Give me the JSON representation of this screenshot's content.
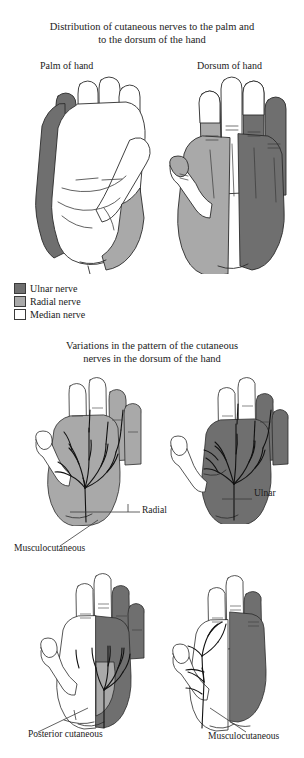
{
  "figure1": {
    "title": "Distribution of cutaneous nerves to the palm and to the dorsum of the hand",
    "title_line1": "Distribution of cutaneous nerves to the palm and",
    "title_line2": "to the dorsum of the hand",
    "panels": [
      {
        "label": "Palm of hand",
        "name": "palm-of-hand"
      },
      {
        "label": "Dorsum of hand",
        "name": "dorsum-of-hand"
      }
    ],
    "legend": [
      {
        "label": "Ulnar nerve",
        "color": "#6f6f6f"
      },
      {
        "label": "Radial nerve",
        "color": "#a9a9a9"
      },
      {
        "label": "Median nerve",
        "color": "#ffffff"
      }
    ]
  },
  "figure2": {
    "title": "Variations in the pattern of the cutaneous nerves in the dorsum of the hand",
    "title_line1": "Variations in the pattern of the cutaneous",
    "title_line2": "nerves in the dorsum of the hand",
    "callouts": [
      {
        "label": "Radial",
        "name": "callout-radial"
      },
      {
        "label": "Ulnar",
        "name": "callout-ulnar"
      },
      {
        "label": "Musculocutaneous",
        "name": "callout-musculocutaneous-upper"
      },
      {
        "label": "Posterior cutaneous",
        "name": "callout-posterior-cutaneous"
      },
      {
        "label": "Musculocutaneous",
        "name": "callout-musculocutaneous-lower"
      }
    ]
  },
  "colors": {
    "ulnar": "#6f6f6f",
    "radial": "#a9a9a9",
    "median": "#ffffff",
    "outline": "#2b2b2b",
    "nerve": "#111111",
    "background": "#ffffff"
  }
}
